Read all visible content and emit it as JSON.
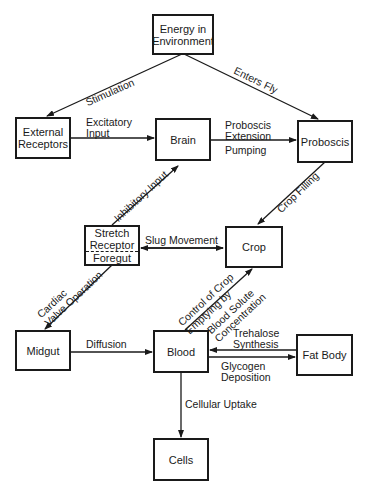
{
  "nodes": {
    "energy": "Energy in\nEnvironment",
    "external_receptors": "External\nReceptors",
    "brain": "Brain",
    "proboscis": "Proboscis",
    "stretch_receptor": "Stretch\nReceptor",
    "foregut": "Foregut",
    "crop": "Crop",
    "midgut": "Midgut",
    "blood": "Blood",
    "fat_body": "Fat Body",
    "cells": "Cells"
  },
  "edges": {
    "stimulation": "Stimulation",
    "enters_fly": "Enters Fly",
    "excitatory_input": "Excitatory\nInput",
    "proboscis_extension": "Proboscis\nExtension",
    "pumping": "Pumping",
    "inhibitory_input": "Inhibitory Input",
    "crop_filling": "Crop Filling",
    "slug_movement": "Slug Movement",
    "cardiac_valve": "Cardiac\nValve Operation",
    "control_crop": "Control of Crop\nEmptying by",
    "blood_solute": "Blood Solute\nConcentration",
    "diffusion": "Diffusion",
    "trehalose": "Trehalose\nSynthesis",
    "glycogen": "Glycogen\nDeposition",
    "cellular_uptake": "Cellular Uptake"
  },
  "colors": {
    "ink": "#1a1a1a",
    "background": "#ffffff"
  }
}
